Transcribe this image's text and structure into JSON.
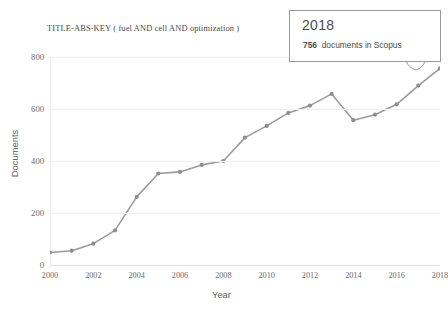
{
  "chart_data": {
    "type": "line",
    "title": "TITLE-ABS-KEY ( fuel  AND cell  AND optimization )",
    "xlabel": "Year",
    "ylabel": "Documents",
    "xlim": [
      2000,
      2018
    ],
    "ylim": [
      0,
      800
    ],
    "grid": true,
    "legend": "none",
    "line_color": "#9b9b9b",
    "marker_color": "#8e8e8e",
    "categories": [
      2000,
      2001,
      2002,
      2003,
      2004,
      2005,
      2006,
      2007,
      2008,
      2009,
      2010,
      2011,
      2012,
      2013,
      2014,
      2015,
      2016,
      2017,
      2018
    ],
    "values": [
      48,
      55,
      82,
      133,
      262,
      352,
      358,
      385,
      400,
      490,
      535,
      585,
      613,
      658,
      557,
      578,
      618,
      690,
      756
    ],
    "x_ticks": [
      "2000",
      "2002",
      "2004",
      "2006",
      "2008",
      "2010",
      "2012",
      "2014",
      "2016",
      "2018"
    ],
    "x_tick_values": [
      2000,
      2002,
      2004,
      2006,
      2008,
      2010,
      2012,
      2014,
      2016,
      2018
    ],
    "y_ticks": [
      "0",
      "200",
      "400",
      "600",
      "800"
    ],
    "y_tick_values": [
      0,
      200,
      400,
      600,
      800
    ],
    "annotations": [
      {
        "name": "hover-tooltip",
        "year": "2018",
        "count": "756",
        "text": "documents in Scopus",
        "points_to": [
          2018,
          756
        ]
      }
    ]
  },
  "tooltip": {
    "year": "2018",
    "count": "756",
    "label": "documents in Scopus"
  },
  "axes": {
    "x_title": "Year",
    "y_title": "Documents"
  },
  "title": "TITLE-ABS-KEY ( fuel  AND cell  AND optimization )"
}
